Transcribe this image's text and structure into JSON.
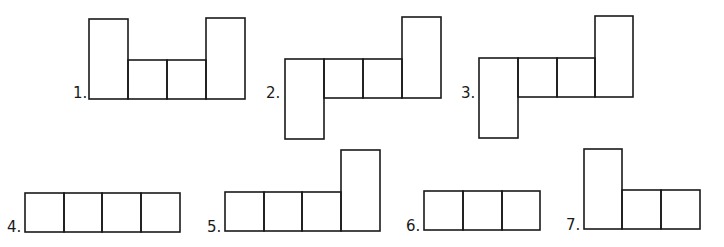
{
  "figures": [
    {
      "label": "1.",
      "label_pos": [
        73,
        98
      ],
      "cells": [
        {
          "x": 89,
          "y": 19,
          "w": 39,
          "h": 80
        },
        {
          "x": 128,
          "y": 60,
          "w": 39,
          "h": 39
        },
        {
          "x": 167,
          "y": 60,
          "w": 39,
          "h": 39
        },
        {
          "x": 206,
          "y": 18,
          "w": 39,
          "h": 81
        }
      ]
    },
    {
      "label": "2.",
      "label_pos": [
        266,
        98
      ],
      "cells": [
        {
          "x": 285,
          "y": 59,
          "w": 39,
          "h": 80
        },
        {
          "x": 324,
          "y": 59,
          "w": 39,
          "h": 39
        },
        {
          "x": 363,
          "y": 59,
          "w": 39,
          "h": 39
        },
        {
          "x": 402,
          "y": 17,
          "w": 39,
          "h": 81
        }
      ]
    },
    {
      "label": "3.",
      "label_pos": [
        461,
        98
      ],
      "cells": [
        {
          "x": 479,
          "y": 58,
          "w": 39,
          "h": 80
        },
        {
          "x": 518,
          "y": 58,
          "w": 39,
          "h": 39
        },
        {
          "x": 557,
          "y": 58,
          "w": 38,
          "h": 39
        },
        {
          "x": 595,
          "y": 16,
          "w": 38,
          "h": 81
        }
      ]
    },
    {
      "label": "4.",
      "label_pos": [
        7,
        232
      ],
      "cells": [
        {
          "x": 25,
          "y": 193,
          "w": 39,
          "h": 39
        },
        {
          "x": 64,
          "y": 193,
          "w": 38,
          "h": 39
        },
        {
          "x": 102,
          "y": 193,
          "w": 39,
          "h": 39
        },
        {
          "x": 141,
          "y": 193,
          "w": 39,
          "h": 39
        }
      ]
    },
    {
      "label": "5.",
      "label_pos": [
        207,
        232
      ],
      "cells": [
        {
          "x": 225,
          "y": 192,
          "w": 39,
          "h": 39
        },
        {
          "x": 264,
          "y": 192,
          "w": 38,
          "h": 39
        },
        {
          "x": 302,
          "y": 192,
          "w": 39,
          "h": 39
        },
        {
          "x": 341,
          "y": 150,
          "w": 39,
          "h": 81
        }
      ]
    },
    {
      "label": "6.",
      "label_pos": [
        406,
        231
      ],
      "cells": [
        {
          "x": 424,
          "y": 191,
          "w": 39,
          "h": 39
        },
        {
          "x": 463,
          "y": 191,
          "w": 39,
          "h": 39
        },
        {
          "x": 502,
          "y": 191,
          "w": 38,
          "h": 39
        }
      ]
    },
    {
      "label": "7.",
      "label_pos": [
        566,
        230
      ],
      "cells": [
        {
          "x": 584,
          "y": 149,
          "w": 38,
          "h": 80
        },
        {
          "x": 622,
          "y": 190,
          "w": 39,
          "h": 39
        },
        {
          "x": 661,
          "y": 190,
          "w": 39,
          "h": 39
        }
      ]
    }
  ]
}
